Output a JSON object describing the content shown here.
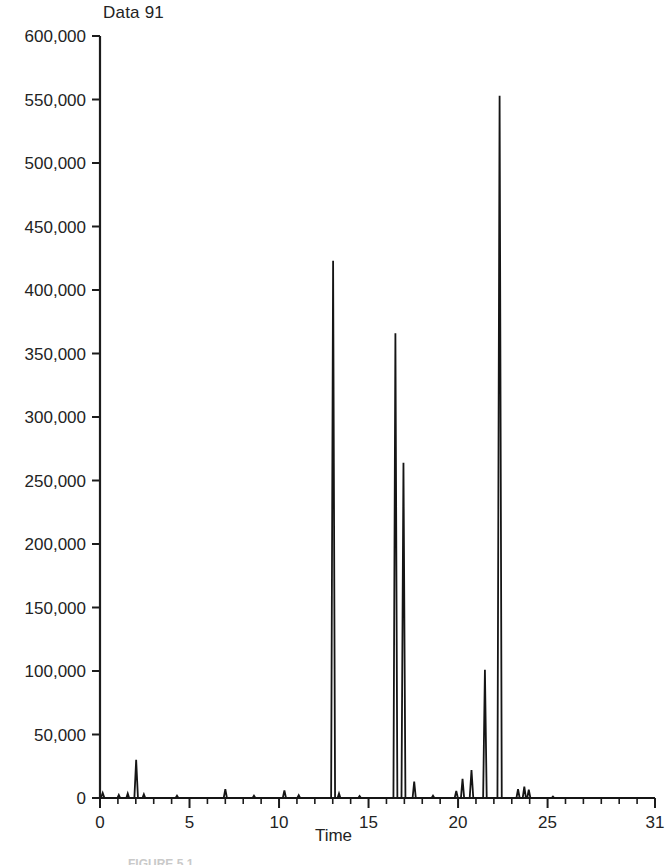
{
  "figure": {
    "title": "Data 91",
    "caption": "FIGURE 5.1"
  },
  "chart_data": {
    "type": "line",
    "title": "Data 91",
    "subtitle": "",
    "xlabel": "Time",
    "ylabel": "",
    "xlim": [
      0,
      31
    ],
    "ylim": [
      0,
      600000
    ],
    "grid": false,
    "legend": "none",
    "x_tick_labels": [
      "0",
      "5",
      "10",
      "15",
      "20",
      "25",
      "31"
    ],
    "x_tick_values": [
      0,
      5,
      10,
      15,
      20,
      25,
      31
    ],
    "x_minor_tick_step": 1,
    "y_tick_labels": [
      "0",
      "50,000",
      "100,000",
      "150,000",
      "200,000",
      "250,000",
      "300,000",
      "350,000",
      "400,000",
      "450,000",
      "500,000",
      "550,000",
      "600,000"
    ],
    "y_tick_values": [
      0,
      50000,
      100000,
      150000,
      200000,
      250000,
      300000,
      350000,
      400000,
      450000,
      500000,
      550000,
      600000
    ],
    "series": [
      {
        "name": "Data 91",
        "color": "#151515",
        "description": "Chromatogram trace: sharp narrow peaks on a flat near-zero baseline.",
        "peaks": [
          {
            "x": 0.15,
            "y": 4000,
            "width": 0.1
          },
          {
            "x": 1.05,
            "y": 2500,
            "width": 0.08
          },
          {
            "x": 1.55,
            "y": 3500,
            "width": 0.08
          },
          {
            "x": 2.02,
            "y": 30000,
            "width": 0.1
          },
          {
            "x": 2.45,
            "y": 3000,
            "width": 0.08
          },
          {
            "x": 4.3,
            "y": 1800,
            "width": 0.08
          },
          {
            "x": 7.0,
            "y": 7000,
            "width": 0.09
          },
          {
            "x": 8.6,
            "y": 1800,
            "width": 0.08
          },
          {
            "x": 10.3,
            "y": 6000,
            "width": 0.09
          },
          {
            "x": 11.1,
            "y": 2200,
            "width": 0.08
          },
          {
            "x": 13.02,
            "y": 423000,
            "width": 0.11
          },
          {
            "x": 13.35,
            "y": 3500,
            "width": 0.08
          },
          {
            "x": 14.5,
            "y": 1500,
            "width": 0.08
          },
          {
            "x": 16.5,
            "y": 366000,
            "width": 0.11
          },
          {
            "x": 16.95,
            "y": 264000,
            "width": 0.11
          },
          {
            "x": 17.55,
            "y": 13000,
            "width": 0.09
          },
          {
            "x": 18.6,
            "y": 1800,
            "width": 0.08
          },
          {
            "x": 19.9,
            "y": 5500,
            "width": 0.09
          },
          {
            "x": 20.25,
            "y": 15000,
            "width": 0.09
          },
          {
            "x": 20.75,
            "y": 22000,
            "width": 0.1
          },
          {
            "x": 21.5,
            "y": 101000,
            "width": 0.1
          },
          {
            "x": 22.32,
            "y": 553000,
            "width": 0.12
          },
          {
            "x": 23.35,
            "y": 7000,
            "width": 0.09
          },
          {
            "x": 23.7,
            "y": 9000,
            "width": 0.09
          },
          {
            "x": 23.95,
            "y": 6500,
            "width": 0.09
          },
          {
            "x": 25.3,
            "y": 1200,
            "width": 0.08
          }
        ]
      }
    ]
  },
  "axes_geometry": {
    "left_px": 100,
    "right_px": 655,
    "bottom_px": 798,
    "top_px": 36
  }
}
